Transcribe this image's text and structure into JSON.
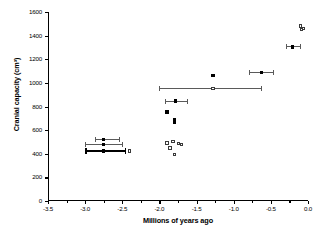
{
  "chart_data": {
    "type": "scatter",
    "title": "",
    "xlabel": "Millions of years ago",
    "ylabel": "Cranial capacity (cm³)",
    "xlim": [
      -3.5,
      0.0
    ],
    "ylim": [
      0,
      1600
    ],
    "xticks": [
      -3.5,
      -3.0,
      -2.5,
      -2.0,
      -1.5,
      -1.0,
      -0.5,
      0.0
    ],
    "xticklabels": [
      "-3.5",
      "-3.0",
      "-2.5",
      "-2.0",
      "-1.5",
      "-1.0",
      "-0.5",
      "0.0"
    ],
    "yticks": [
      0,
      200,
      400,
      600,
      800,
      1000,
      1200,
      1400,
      1600
    ],
    "yticklabels": [
      "0",
      "200",
      "400",
      "600",
      "800",
      "1000",
      "1200",
      "1400",
      "1600"
    ],
    "grid": false,
    "legend": null,
    "series": [
      {
        "name": "filled-with-error-bars",
        "marker": "filled-square",
        "points": [
          {
            "x": -2.75,
            "y": 520,
            "xerr_low": -2.87,
            "xerr_high": -2.55,
            "bar": "thin"
          },
          {
            "x": -2.75,
            "y": 480,
            "xerr_low": -3.0,
            "xerr_high": -2.5,
            "bar": "thin"
          },
          {
            "x": -2.75,
            "y": 425,
            "xerr_low": -3.0,
            "xerr_high": -2.47,
            "bar": "thick"
          },
          {
            "x": -1.78,
            "y": 845,
            "xerr_low": -1.93,
            "xerr_high": -1.63,
            "bar": "thin"
          },
          {
            "x": -0.63,
            "y": 1090,
            "xerr_low": -0.8,
            "xerr_high": -0.47,
            "bar": "thin"
          },
          {
            "x": -0.21,
            "y": 1305,
            "xerr_low": -0.3,
            "xerr_high": -0.11,
            "bar": "thin"
          }
        ]
      },
      {
        "name": "open-with-error-bars",
        "marker": "open-square",
        "points": [
          {
            "x": -1.28,
            "y": 950,
            "xerr_low": -2.0,
            "xerr_high": -0.63,
            "bar": "thin"
          }
        ]
      },
      {
        "name": "filled-no-error-bars",
        "marker": "filled-square",
        "points": [
          {
            "x": -1.9,
            "y": 752
          },
          {
            "x": -1.8,
            "y": 690
          },
          {
            "x": -1.8,
            "y": 675
          },
          {
            "x": -1.8,
            "y": 666
          },
          {
            "x": -1.28,
            "y": 1065
          }
        ]
      },
      {
        "name": "open-no-error-bars",
        "marker": "open-square",
        "points": [
          {
            "x": -2.4,
            "y": 425
          },
          {
            "x": -1.9,
            "y": 492
          },
          {
            "x": -1.86,
            "y": 450
          },
          {
            "x": -1.82,
            "y": 505
          },
          {
            "x": -1.8,
            "y": 395
          },
          {
            "x": -1.74,
            "y": 485
          },
          {
            "x": -1.7,
            "y": 478
          },
          {
            "x": -0.1,
            "y": 1480
          },
          {
            "x": -0.07,
            "y": 1462
          },
          {
            "x": -0.09,
            "y": 1452
          }
        ]
      }
    ]
  },
  "colors": {
    "axis": "#000000",
    "marker_filled": "#000000",
    "marker_open_edge": "#3a3a3a",
    "errorbar": "#5a5a5a",
    "background": "#ffffff"
  }
}
